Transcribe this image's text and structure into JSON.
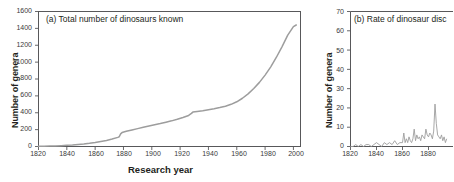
{
  "figure": {
    "panel_count": 2,
    "background_color": "#ffffff",
    "line_color": "#9d9d9d",
    "axis_color": "#58585a"
  },
  "panel_a": {
    "title": "(a) Total number of dinosaurs known",
    "ylabel": "Number of genera",
    "xlabel": "Research year",
    "yticks": [
      "0",
      "200",
      "400",
      "600",
      "800",
      "1000",
      "1200",
      "1400",
      "1600"
    ],
    "xticks": [
      "1820",
      "1840",
      "1860",
      "1880",
      "1900",
      "1920",
      "1940",
      "1960",
      "1980",
      "2000"
    ]
  },
  "panel_b": {
    "title": "(b) Rate of dinosaur disc",
    "title_truncated": true,
    "ylabel": "Number of genera",
    "yticks": [
      "0",
      "10",
      "20",
      "30",
      "40",
      "50",
      "60",
      "70"
    ],
    "xticks": [
      "1820",
      "1840",
      "1860",
      "1880"
    ]
  },
  "chart_data": [
    {
      "type": "line",
      "panel": "a",
      "title": "(a) Total number of dinosaurs known",
      "xlabel": "Research year",
      "ylabel": "Number of genera",
      "xlim": [
        1820,
        2005
      ],
      "ylim": [
        0,
        1600
      ],
      "grid": false,
      "legend": "none",
      "series": [
        {
          "name": "Cumulative number of dinosaur genera known",
          "x": [
            1820,
            1824,
            1828,
            1832,
            1836,
            1840,
            1844,
            1848,
            1852,
            1856,
            1860,
            1864,
            1868,
            1872,
            1876,
            1877,
            1878,
            1879,
            1882,
            1886,
            1890,
            1894,
            1898,
            1902,
            1906,
            1910,
            1914,
            1918,
            1922,
            1926,
            1928,
            1929,
            1932,
            1936,
            1940,
            1944,
            1948,
            1952,
            1956,
            1960,
            1964,
            1968,
            1972,
            1976,
            1980,
            1984,
            1988,
            1992,
            1996,
            2000,
            2002
          ],
          "y": [
            2,
            3,
            5,
            7,
            10,
            14,
            18,
            24,
            30,
            38,
            48,
            60,
            72,
            88,
            108,
            115,
            150,
            165,
            180,
            196,
            212,
            228,
            244,
            258,
            272,
            288,
            304,
            322,
            344,
            368,
            392,
            408,
            416,
            424,
            436,
            448,
            462,
            478,
            500,
            530,
            572,
            624,
            688,
            760,
            846,
            944,
            1058,
            1184,
            1320,
            1420,
            1440
          ]
        }
      ]
    },
    {
      "type": "line",
      "panel": "b",
      "title": "(b) Rate of dinosaur disc",
      "xlabel": "Research year",
      "ylabel": "Number of genera",
      "xlim": [
        1820,
        1895
      ],
      "ylim": [
        0,
        70
      ],
      "grid": false,
      "legend": "none",
      "series": [
        {
          "name": "Annual rate of dinosaur genus discovery",
          "x": [
            1820,
            1822,
            1824,
            1826,
            1828,
            1830,
            1832,
            1834,
            1836,
            1838,
            1840,
            1842,
            1844,
            1846,
            1848,
            1850,
            1852,
            1854,
            1856,
            1858,
            1860,
            1861,
            1862,
            1863,
            1864,
            1865,
            1866,
            1867,
            1868,
            1869,
            1870,
            1871,
            1872,
            1873,
            1874,
            1875,
            1876,
            1877,
            1878,
            1879,
            1880,
            1881,
            1882,
            1883,
            1884,
            1885,
            1886,
            1887,
            1888,
            1889,
            1890,
            1891,
            1892,
            1893,
            1894
          ],
          "y": [
            0,
            0,
            1,
            0,
            1,
            0,
            1,
            1,
            0,
            1,
            2,
            1,
            0,
            2,
            1,
            2,
            1,
            3,
            1,
            2,
            2,
            7,
            2,
            4,
            2,
            5,
            3,
            2,
            4,
            9,
            3,
            6,
            4,
            5,
            3,
            6,
            5,
            4,
            9,
            6,
            5,
            7,
            6,
            4,
            8,
            22,
            12,
            6,
            5,
            4,
            6,
            3,
            5,
            2,
            4
          ]
        }
      ]
    }
  ]
}
